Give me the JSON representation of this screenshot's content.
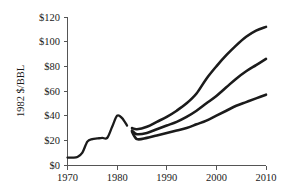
{
  "chart_data": {
    "type": "line",
    "title": "",
    "xlabel": "",
    "ylabel": "1982 $/BBL",
    "xlim": [
      1970,
      2010
    ],
    "ylim": [
      0,
      120
    ],
    "grid": false,
    "legend": "none",
    "x_ticks": [
      "1970",
      "1980",
      "1990",
      "2000",
      "2010"
    ],
    "x_tick_values": [
      1970,
      1980,
      1990,
      2000,
      2010
    ],
    "y_ticks": [
      "$0",
      "$20",
      "$40",
      "$60",
      "$80",
      "$100",
      "$120"
    ],
    "y_tick_values": [
      0,
      20,
      40,
      60,
      80,
      100,
      120
    ],
    "series": [
      {
        "name": "historical",
        "x": [
          1970,
          1971,
          1972,
          1973,
          1974,
          1975,
          1976,
          1977,
          1978,
          1979,
          1980,
          1981,
          1982
        ],
        "values": [
          6,
          6,
          6.5,
          10,
          19,
          21,
          21.5,
          22,
          22,
          31,
          40,
          38,
          32
        ]
      },
      {
        "name": "high-projection",
        "x": [
          1983,
          1984,
          1986,
          1988,
          1990,
          1992,
          1994,
          1996,
          1998,
          2000,
          2002,
          2004,
          2006,
          2008,
          2010
        ],
        "values": [
          30,
          29,
          31,
          35,
          39,
          44,
          50,
          58,
          70,
          80,
          89,
          97,
          104,
          109,
          112
        ]
      },
      {
        "name": "mid-projection",
        "x": [
          1983,
          1984,
          1986,
          1988,
          1990,
          1992,
          1994,
          1996,
          1998,
          2000,
          2002,
          2004,
          2006,
          2008,
          2010
        ],
        "values": [
          28,
          25,
          26,
          29,
          32,
          35,
          39,
          44,
          50,
          56,
          63,
          70,
          76,
          81,
          86
        ]
      },
      {
        "name": "low-projection",
        "x": [
          1983,
          1984,
          1986,
          1988,
          1990,
          1992,
          1994,
          1996,
          1998,
          2000,
          2002,
          2004,
          2006,
          2008,
          2010
        ],
        "values": [
          27,
          21,
          22,
          24,
          26,
          28,
          30,
          33,
          36,
          40,
          44,
          48,
          51,
          54,
          57
        ]
      }
    ],
    "colors": {
      "line": "#1b1b1b",
      "axis": "#555555",
      "text": "#1a1a1a",
      "background": "#ffffff"
    }
  }
}
